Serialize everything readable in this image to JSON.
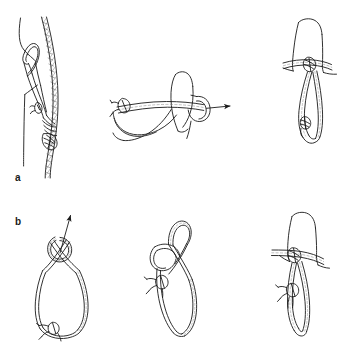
{
  "figure": {
    "background_color": "#ffffff",
    "line_color": "#1a1a1a",
    "width": 355,
    "height": 358,
    "style": "black-and-white technical line drawing"
  },
  "rows": [
    {
      "id": "a",
      "label": "a",
      "label_position": {
        "x": 15,
        "y": 173
      },
      "description": "Webbing sling wrapped around a rope and around the thumb",
      "panels": [
        {
          "id": "a1",
          "name": "rope-with-klemheist-hitch",
          "caption_text": "",
          "elements": [
            "rope-strand",
            "webbing-sling",
            "hitch-knot",
            "buckle-knot"
          ]
        },
        {
          "id": "a2",
          "name": "thumb-with-webbing-wrap",
          "caption_text": "",
          "elements": [
            "thumb",
            "webbing-strap",
            "buckle-knot",
            "pull-arrow"
          ],
          "arrow": {
            "direction": "right",
            "name": "pull-direction-arrow"
          }
        },
        {
          "id": "a3",
          "name": "finished-hitch-on-thumb",
          "caption_text": "",
          "elements": [
            "thumb",
            "webbing-wrap",
            "hanging-loop",
            "buckle-knot"
          ]
        }
      ]
    },
    {
      "id": "b",
      "label": "b",
      "label_position": {
        "x": 15,
        "y": 217
      },
      "description": "Webbing sling twisted into a loop and dressed into the hitch",
      "panels": [
        {
          "id": "b1",
          "name": "twisted-webbing-loop",
          "caption_text": "",
          "elements": [
            "webbing-loop",
            "twist-crossing",
            "buckle-knot",
            "pull-arrow"
          ],
          "arrow": {
            "direction": "up-right",
            "name": "pull-direction-arrow"
          }
        },
        {
          "id": "b2",
          "name": "webbing-loop-with-bight",
          "caption_text": "",
          "elements": [
            "webbing-loop",
            "bight",
            "buckle-knot"
          ]
        },
        {
          "id": "b3",
          "name": "finished-hitch-on-thumb",
          "caption_text": "",
          "elements": [
            "thumb",
            "webbing-wrap",
            "hanging-loop",
            "buckle-knot"
          ]
        }
      ]
    }
  ]
}
